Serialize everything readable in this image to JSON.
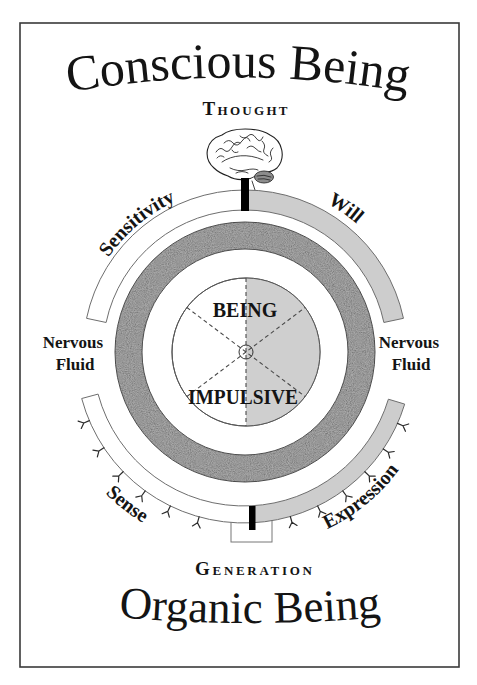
{
  "titles": {
    "top": "Conscious Being",
    "bottom": "Organic Being"
  },
  "poles": {
    "top": "Thought",
    "bottom": "Generation"
  },
  "upper_arcs": {
    "left": "Sensitivity",
    "right": "Will"
  },
  "lower_arcs": {
    "left": "Sense",
    "right": "Expression"
  },
  "side_labels": {
    "left": [
      "Nervous",
      "Fluid"
    ],
    "right": [
      "Nervous",
      "Fluid"
    ]
  },
  "core": {
    "top": "BEING",
    "bottom": "IMPULSIVE"
  },
  "colors": {
    "frame": "#3a3a3a",
    "light_fill": "#cdcdcd",
    "stippled_ring": "#8a8a8a",
    "bar": "#000000"
  }
}
